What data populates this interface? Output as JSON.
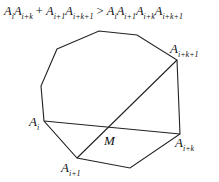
{
  "formula": {
    "lhs": "A_iA_{i+k} + A_{i+1}A_{i+k+1}",
    "op": ">",
    "rhs": "A_iA_{i+1}A_{i+k}A_{i+k+1}",
    "parts": [
      {
        "b": "A",
        "s": "i"
      },
      {
        "b": "A",
        "s": "i+k"
      },
      {
        "t": " + "
      },
      {
        "b": "A",
        "s": "i+1"
      },
      {
        "b": "A",
        "s": "i+k+1"
      },
      {
        "t": " > "
      },
      {
        "b": "A",
        "s": "i"
      },
      {
        "b": "A",
        "s": "i+1"
      },
      {
        "b": "A",
        "s": "i+k"
      },
      {
        "b": "A",
        "s": "i+k+1"
      }
    ]
  },
  "polygon": {
    "vertices": [
      [
        57,
        49
      ],
      [
        99,
        31
      ],
      [
        137,
        35
      ],
      [
        177,
        60
      ],
      [
        180,
        134
      ],
      [
        130,
        168
      ],
      [
        77,
        158
      ],
      [
        44,
        121
      ],
      [
        41,
        86
      ]
    ],
    "stroke": "#222222"
  },
  "diagonals": [
    {
      "from": [
        44,
        121
      ],
      "to": [
        180,
        134
      ],
      "name": "Ai-Ai+k"
    },
    {
      "from": [
        77,
        158
      ],
      "to": [
        177,
        60
      ],
      "name": "Ai+1-Ai+k+1"
    }
  ],
  "labels": [
    {
      "id": "Ai",
      "base": "A",
      "sub": "i",
      "x": 29,
      "y": 114
    },
    {
      "id": "Ai+1",
      "base": "A",
      "sub": "i+1",
      "x": 61,
      "y": 160
    },
    {
      "id": "Ai+k",
      "base": "A",
      "sub": "i+k",
      "x": 175,
      "y": 135
    },
    {
      "id": "Ai+k+1",
      "base": "A",
      "sub": "i+k+1",
      "x": 170,
      "y": 41
    },
    {
      "id": "M",
      "base": "M",
      "sub": "",
      "x": 104,
      "y": 133
    }
  ]
}
